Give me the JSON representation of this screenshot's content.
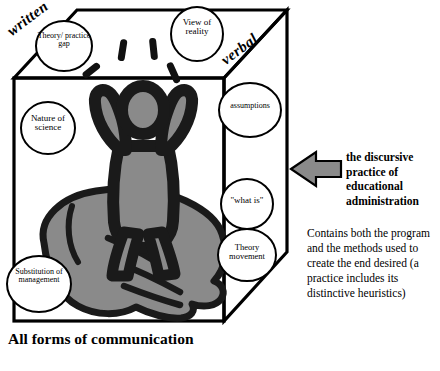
{
  "diagram": {
    "title_caption": "All forms of communication",
    "edge_labels": {
      "left": "written",
      "right": "verbal"
    },
    "bubbles": [
      {
        "id": "theory-practice-gap",
        "text": "Theory/ practice gap"
      },
      {
        "id": "view-of-reality",
        "text": "View of reality"
      },
      {
        "id": "assumptions",
        "text": "assumptions"
      },
      {
        "id": "nature-of-science",
        "text": "Nature of science"
      },
      {
        "id": "what-is",
        "text": "\"what is\""
      },
      {
        "id": "theory-movement",
        "text": "Theory movement"
      },
      {
        "id": "substitution-of-management",
        "text": "Substitution of management"
      }
    ],
    "annotation": {
      "headline": "the discursive practice of educational administration",
      "body": "Contains both the program and the methods used to create the end desired (a practice includes its distinctive heuristics)"
    },
    "colors": {
      "ink": "#000000",
      "figure_gray": "#8a8a8a",
      "arrow_gray": "#8a8a8a",
      "background": "#ffffff"
    }
  }
}
